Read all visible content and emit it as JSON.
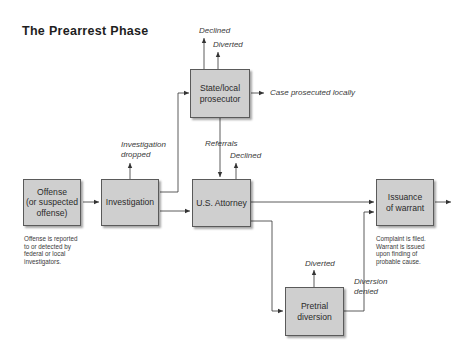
{
  "diagram": {
    "title": "The Prearrest Phase",
    "nodes": {
      "state_local": "State/local\nprosecutor",
      "offense": "Offense\n(or suspected\noffense)",
      "investigation": "Investigation",
      "us_attorney": "U.S. Attorney",
      "warrant": "Issuance\nof warrant",
      "pretrial": "Pretrial\ndiversion"
    },
    "edge_labels": {
      "state_declined": "Declined",
      "state_diverted": "Diverted",
      "case_local": "Case prosecuted locally",
      "investigation_dropped": "Investigation\ndropped",
      "referrals": "Referrals",
      "usa_declined": "Declined",
      "pretrial_diverted": "Diverted",
      "diversion_denied": "Diversion\ndenied"
    },
    "notes": {
      "offense": "Offense is reported\nto or detected by\nfederal or local\ninvestigators.",
      "warrant": "Complaint is filed.\nWarrant is issued\nupon finding of\nprobable cause."
    },
    "colors": {
      "box_fill": "#cfcfcf",
      "box_border": "#5a5a5a",
      "line": "#333333"
    }
  }
}
